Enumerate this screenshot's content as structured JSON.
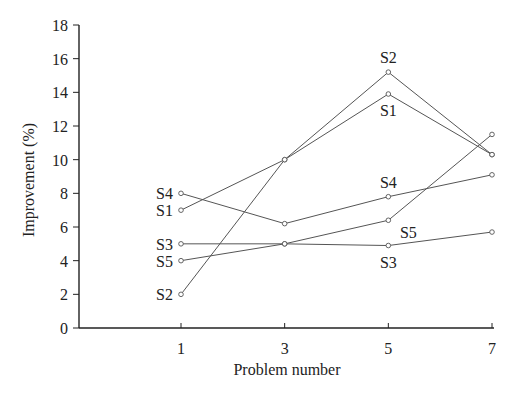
{
  "chart_data": {
    "type": "line",
    "title": "",
    "xlabel": "Problem number",
    "ylabel": "Improvement (%)",
    "x": [
      1,
      3,
      5,
      7
    ],
    "xticks": [
      "1",
      "3",
      "5",
      "7"
    ],
    "yticks": [
      "0",
      "2",
      "4",
      "6",
      "8",
      "10",
      "12",
      "14",
      "16",
      "18"
    ],
    "ylim": [
      0,
      18
    ],
    "xlim": [
      -0.95,
      7.1
    ],
    "grid": false,
    "legend": "none (direct series labels)",
    "series": [
      {
        "name": "S1",
        "values": [
          7.0,
          10.0,
          13.9,
          10.3
        ]
      },
      {
        "name": "S2",
        "values": [
          2.0,
          10.0,
          15.2,
          10.3
        ]
      },
      {
        "name": "S3",
        "values": [
          5.0,
          5.0,
          4.9,
          5.7
        ]
      },
      {
        "name": "S4",
        "values": [
          8.0,
          6.2,
          7.8,
          9.1
        ]
      },
      {
        "name": "S5",
        "values": [
          4.0,
          5.0,
          6.4,
          11.5
        ]
      }
    ],
    "annotations": [
      {
        "text": "S4",
        "x": 1,
        "side": "left",
        "y": 8.0
      },
      {
        "text": "S1",
        "x": 1,
        "side": "left",
        "y": 7.0
      },
      {
        "text": "S3",
        "x": 1,
        "side": "left",
        "y": 5.0
      },
      {
        "text": "S5",
        "x": 1,
        "side": "left",
        "y": 4.0
      },
      {
        "text": "S2",
        "x": 1,
        "side": "left",
        "y": 2.0
      },
      {
        "text": "S2",
        "x": 5,
        "side": "above",
        "y": 15.2
      },
      {
        "text": "S1",
        "x": 5,
        "side": "below",
        "y": 13.9
      },
      {
        "text": "S4",
        "x": 5,
        "side": "above",
        "y": 7.8
      },
      {
        "text": "S5",
        "x": 5,
        "side": "below-right",
        "y": 6.4
      },
      {
        "text": "S3",
        "x": 5,
        "side": "below",
        "y": 4.9
      }
    ]
  }
}
